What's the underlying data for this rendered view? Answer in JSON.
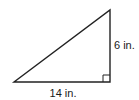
{
  "figure": {
    "shape": "right-triangle",
    "stroke_color": "#222222",
    "background": "#ffffff",
    "vertices": {
      "bottom_left": [
        14,
        82
      ],
      "bottom_right": [
        110,
        82
      ],
      "top": [
        110,
        10
      ]
    },
    "right_angle_marker": {
      "corner": "bottom-right",
      "size": 7
    },
    "labels": {
      "base": "14 in.",
      "height": "6 in."
    }
  }
}
